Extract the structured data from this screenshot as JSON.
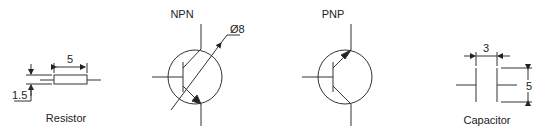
{
  "diagram": {
    "line_color": "#333333",
    "components": [
      {
        "id": "resistor",
        "label": "Resistor",
        "dimensions": {
          "length": "5",
          "height": "1.5"
        }
      },
      {
        "id": "npn",
        "label": "NPN",
        "dimensions": {
          "diameter": "Ø8"
        }
      },
      {
        "id": "pnp",
        "label": "PNP"
      },
      {
        "id": "capacitor",
        "label": "Capacitor",
        "dimensions": {
          "gap": "3",
          "plate_height": "5"
        }
      }
    ]
  }
}
